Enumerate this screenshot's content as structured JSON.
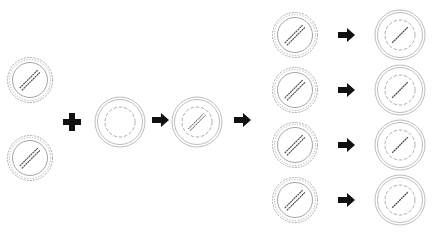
{
  "diagram": {
    "colors": {
      "stroke": "#9a9a9a",
      "dark": "#444444",
      "arrow": "#111111",
      "background": "#ffffff"
    },
    "source_cells": [
      {
        "id": "gear-cell-1",
        "cx": 30,
        "cy": 80
      },
      {
        "id": "gear-cell-2",
        "cx": 30,
        "cy": 158
      }
    ],
    "operator": {
      "symbol": "plus",
      "cx": 72,
      "cy": 122
    },
    "empty_dish": {
      "cx": 120,
      "cy": 122
    },
    "loaded_dish": {
      "cx": 197,
      "cy": 122
    },
    "arrows": [
      {
        "x": 152,
        "y": 120
      },
      {
        "x": 234,
        "y": 120
      },
      {
        "x": 338,
        "y": 35
      },
      {
        "x": 338,
        "y": 90
      },
      {
        "x": 338,
        "y": 145
      },
      {
        "x": 338,
        "y": 200
      }
    ],
    "output_gears": [
      {
        "cx": 295,
        "cy": 35
      },
      {
        "cx": 295,
        "cy": 90
      },
      {
        "cx": 295,
        "cy": 145
      },
      {
        "cx": 295,
        "cy": 200
      }
    ],
    "output_dishes": [
      {
        "cx": 400,
        "cy": 35
      },
      {
        "cx": 400,
        "cy": 90
      },
      {
        "cx": 400,
        "cy": 145
      },
      {
        "cx": 400,
        "cy": 200
      }
    ]
  }
}
